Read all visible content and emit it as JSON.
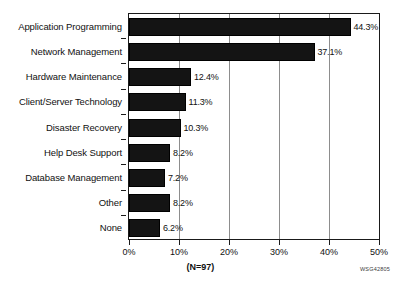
{
  "chart_data": {
    "type": "bar",
    "orientation": "horizontal",
    "title": "",
    "xlabel": "",
    "ylabel": "",
    "xlim": [
      0,
      50
    ],
    "grid": true,
    "legend": false,
    "categories": [
      "Application Programming",
      "Network Management",
      "Hardware Maintenance",
      "Client/Server Technology",
      "Disaster Recovery",
      "Help Desk Support",
      "Database Management",
      "Other",
      "None"
    ],
    "values": [
      44.3,
      37.1,
      12.4,
      11.3,
      10.3,
      8.2,
      7.2,
      8.2,
      6.2
    ],
    "value_labels": [
      "44.3%",
      "37.1%",
      "12.4%",
      "11.3%",
      "10.3%",
      "8.2%",
      "7.2%",
      "8.2%",
      "6.2%"
    ],
    "xticks": [
      0,
      10,
      20,
      30,
      40,
      50
    ],
    "xtick_labels": [
      "0%",
      "10%",
      "20%",
      "30%",
      "40%",
      "50%"
    ],
    "annotations": {
      "sample_size": "(N=97)",
      "document_code": "WSG42805"
    },
    "colors": {
      "bar_fill": "#141414",
      "bar_edge": "#000000",
      "axis": "#1a1a1a",
      "grid": "#8d8d8d",
      "text": "#111111",
      "background": "#ffffff"
    }
  }
}
